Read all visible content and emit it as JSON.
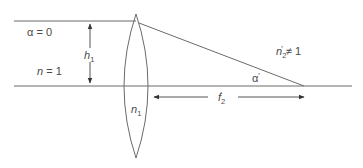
{
  "diagram": {
    "type": "optics-lens-ray-diagram",
    "colors": {
      "line": "#6b6b6b",
      "text": "#4a4a4a",
      "background": "#ffffff"
    },
    "labels": {
      "alpha_incident": {
        "symbol": "α",
        "eq": " = 0"
      },
      "height": {
        "symbol": "h",
        "sub": "1"
      },
      "n_object": {
        "symbol": "n",
        "eq": " = 1"
      },
      "lens_index": {
        "symbol": "n",
        "sub": "1"
      },
      "n_image": {
        "symbol": "n",
        "sub": "2",
        "prime": "′",
        "eq": " ≠ 1"
      },
      "alpha_image": {
        "symbol": "α",
        "prime": "′"
      },
      "focal_length": {
        "symbol": "f",
        "sub": "2",
        "prime": "′"
      }
    },
    "elements": [
      "incident-ray",
      "optical-axis",
      "biconvex-lens",
      "refracted-ray",
      "height-dimension-arrow",
      "focal-length-dimension-arrow"
    ]
  }
}
